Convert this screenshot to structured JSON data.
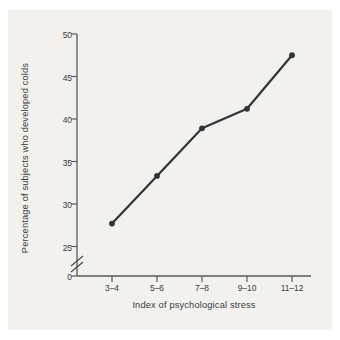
{
  "figure": {
    "background_color": "#f2f1ee",
    "page_color": "#ffffff",
    "ink_color": "#33333a",
    "axis_color": "#5a5a5e"
  },
  "chart_data": {
    "type": "line",
    "title": "",
    "xlabel": "Index of psychological stress",
    "ylabel": "Percentage of subjects who developed colds",
    "categories": [
      "3–4",
      "5–6",
      "7–8",
      "9–10",
      "11–12"
    ],
    "values": [
      27.7,
      33.3,
      38.9,
      41.2,
      47.5
    ],
    "yticks": [
      25,
      30,
      35,
      40,
      45,
      50
    ],
    "ytick_labels": [
      "25",
      "30",
      "35",
      "40",
      "45",
      "50"
    ],
    "y_origin_label": "0",
    "ylim": [
      25,
      50
    ],
    "axis_break": true,
    "axis_break_note": "broken y-axis between 0 and 25",
    "grid": false,
    "legend": "none",
    "marker": "filled-circle",
    "line_color": "#33333a",
    "marker_color": "#33333a"
  },
  "axes": {
    "x_title": "Index of psychological stress",
    "y_title": "Percentage of subjects who developed colds",
    "x_tick_labels": [
      "3–4",
      "5–6",
      "7–8",
      "9–10",
      "11–12"
    ],
    "y_tick_labels": [
      "50",
      "45",
      "40",
      "35",
      "30",
      "25"
    ],
    "y_zero_label": "0"
  }
}
